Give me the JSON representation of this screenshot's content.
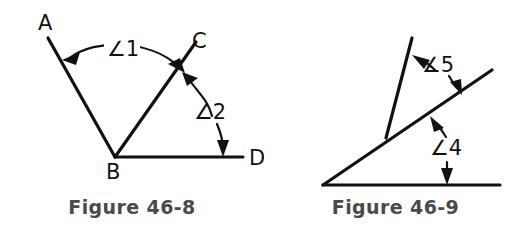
{
  "page": {
    "background_color": "#ffffff",
    "ink_color": "#111111",
    "caption_color": "#4a4a4a",
    "width": 527,
    "height": 238
  },
  "figures": [
    {
      "id": "figure-46-8",
      "caption": "Figure 46-8",
      "description": "Angle ABC and angle CBD sharing vertex B with ray BC between ray BA and ray BD",
      "point_labels": [
        {
          "name": "A",
          "text": "A",
          "x": 38,
          "y": 30
        },
        {
          "name": "B",
          "text": "B",
          "x": 106,
          "y": 179
        },
        {
          "name": "C",
          "text": "C",
          "x": 192,
          "y": 48
        },
        {
          "name": "D",
          "text": "D",
          "x": 249,
          "y": 165
        }
      ],
      "angle_labels": [
        {
          "name": "angle-1",
          "text": "∠1",
          "x": 107,
          "y": 56
        },
        {
          "name": "angle-2",
          "text": "∠2",
          "x": 194,
          "y": 119
        }
      ],
      "rays": [
        {
          "name": "ray-ba",
          "from": [
            115,
            157
          ],
          "to": [
            48,
            38
          ]
        },
        {
          "name": "ray-bc",
          "from": [
            115,
            157
          ],
          "to": [
            196,
            42
          ]
        },
        {
          "name": "ray-bd",
          "from": [
            115,
            157
          ],
          "to": [
            243,
            157
          ]
        }
      ]
    },
    {
      "id": "figure-46-9",
      "caption": "Figure 46-9",
      "description": "Two rays from a common baseline forming angle 4 and angle 5",
      "point_labels": [],
      "angle_labels": [
        {
          "name": "angle-5",
          "text": "∠5",
          "x": 422,
          "y": 72
        },
        {
          "name": "angle-4",
          "text": "∠4",
          "x": 430,
          "y": 155
        }
      ],
      "rays": [
        {
          "name": "baseline",
          "from": [
            323,
            185
          ],
          "to": [
            500,
            185
          ]
        },
        {
          "name": "ray-diagonal",
          "from": [
            323,
            185
          ],
          "to": [
            492,
            70
          ]
        },
        {
          "name": "ray-steep",
          "from": [
            386,
            138
          ],
          "to": [
            412,
            38
          ]
        }
      ]
    }
  ]
}
